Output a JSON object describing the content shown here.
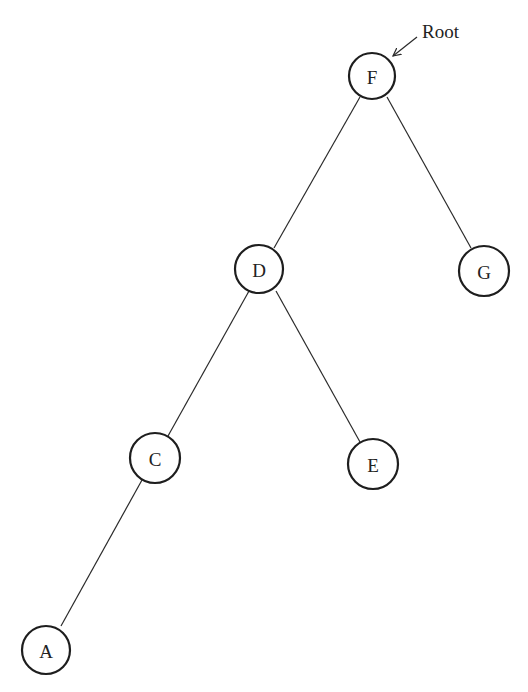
{
  "diagram": {
    "type": "binary-tree",
    "root_label": {
      "text": "Root",
      "x": 422,
      "y": 38
    },
    "root_pointer": {
      "from": [
        417,
        37
      ],
      "to": [
        393,
        56
      ],
      "target": "F"
    },
    "nodes": [
      {
        "id": "F",
        "label": "F",
        "cx": 372,
        "cy": 76,
        "r": 23
      },
      {
        "id": "D",
        "label": "D",
        "cx": 259,
        "cy": 269,
        "r": 24
      },
      {
        "id": "G",
        "label": "G",
        "cx": 484,
        "cy": 271,
        "r": 25
      },
      {
        "id": "C",
        "label": "C",
        "cx": 155,
        "cy": 458,
        "r": 25
      },
      {
        "id": "E",
        "label": "E",
        "cx": 373,
        "cy": 464,
        "r": 25
      },
      {
        "id": "A",
        "label": "A",
        "cx": 46,
        "cy": 650,
        "r": 24
      }
    ],
    "edges": [
      {
        "from": "F",
        "to": "D",
        "x1": 360,
        "y1": 97,
        "x2": 274,
        "y2": 248
      },
      {
        "from": "F",
        "to": "G",
        "x1": 387,
        "y1": 97,
        "x2": 471,
        "y2": 248
      },
      {
        "from": "D",
        "to": "C",
        "x1": 249,
        "y1": 291,
        "x2": 168,
        "y2": 436
      },
      {
        "from": "D",
        "to": "E",
        "x1": 276,
        "y1": 291,
        "x2": 360,
        "y2": 442
      },
      {
        "from": "C",
        "to": "A",
        "x1": 142,
        "y1": 480,
        "x2": 61,
        "y2": 626
      }
    ],
    "colors": {
      "stroke": "#1e1e1e",
      "background": "#ffffff",
      "text": "#222222"
    }
  }
}
